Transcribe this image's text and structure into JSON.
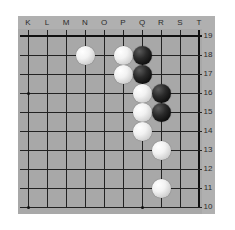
{
  "board": {
    "type": "go-board-diagram",
    "title": "Go board partial view",
    "size": 19,
    "visible_columns": [
      "K",
      "L",
      "M",
      "N",
      "O",
      "P",
      "Q",
      "R",
      "S",
      "T"
    ],
    "visible_rows": [
      "19",
      "18",
      "17",
      "16",
      "15",
      "14",
      "13",
      "12",
      "11",
      "10"
    ],
    "background_color": "#a8a8a8",
    "line_color": "#222222",
    "label_color": "#2b2b2b",
    "white_color": "#ffffff",
    "black_color": "#0b0b0b",
    "star_points": [
      {
        "col": "K",
        "row": "16"
      },
      {
        "col": "K",
        "row": "10"
      },
      {
        "col": "Q",
        "row": "10"
      }
    ],
    "stones": [
      {
        "col": "N",
        "row": "18",
        "color": "white"
      },
      {
        "col": "P",
        "row": "18",
        "color": "white"
      },
      {
        "col": "Q",
        "row": "18",
        "color": "black"
      },
      {
        "col": "P",
        "row": "17",
        "color": "white"
      },
      {
        "col": "Q",
        "row": "17",
        "color": "black"
      },
      {
        "col": "Q",
        "row": "16",
        "color": "white"
      },
      {
        "col": "R",
        "row": "16",
        "color": "black"
      },
      {
        "col": "Q",
        "row": "15",
        "color": "white"
      },
      {
        "col": "R",
        "row": "15",
        "color": "black"
      },
      {
        "col": "Q",
        "row": "14",
        "color": "white"
      },
      {
        "col": "R",
        "row": "13",
        "color": "white"
      },
      {
        "col": "R",
        "row": "11",
        "color": "white"
      }
    ],
    "counts": {
      "white": 8,
      "black": 4
    }
  }
}
